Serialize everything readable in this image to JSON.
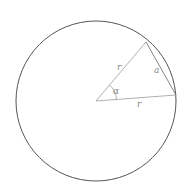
{
  "diagram": {
    "type": "geometry",
    "circle": {
      "cx": 96,
      "cy": 101,
      "r": 80,
      "stroke": "#555555"
    },
    "center": {
      "x": 96,
      "y": 101
    },
    "points": {
      "upper": {
        "x": 146,
        "y": 42
      },
      "right": {
        "x": 176,
        "y": 95
      }
    },
    "line_color": "#9a9a9a",
    "labels": {
      "radius_upper": "r",
      "radius_lower": "r",
      "angle": "α",
      "chord": "a"
    }
  }
}
